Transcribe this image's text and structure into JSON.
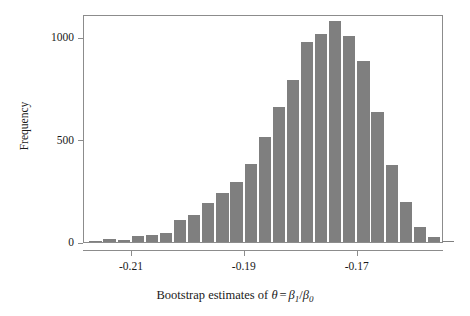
{
  "chart_data": {
    "type": "bar",
    "subtype": "histogram",
    "title": "",
    "subtitle": "",
    "xlabel": "Bootstrap estimates of θ = β₁/β₀",
    "xlabel_parts": {
      "prefix": "Bootstrap estimates of ",
      "theta": "θ",
      "equals": "=",
      "numerator": "β",
      "numerator_sub": "1",
      "slash": "/",
      "denominator": "β",
      "denominator_sub": "0"
    },
    "ylabel": "Frequency",
    "xlim": [
      -0.2185,
      -0.1547
    ],
    "ylim": [
      0,
      1113
    ],
    "xticks": [
      -0.21,
      -0.19,
      -0.17
    ],
    "xtick_labels": [
      "-0.21",
      "-0.19",
      "-0.17"
    ],
    "yticks": [
      0,
      500,
      1000
    ],
    "ytick_labels": [
      "0",
      "500",
      "1000"
    ],
    "grid": false,
    "legend": false,
    "bar_color": "#7f7f7f",
    "axis_color": "#8c8c8c",
    "text_color": "#1a1a1a",
    "background_color": "#ffffff",
    "bin_width": 0.0025,
    "n_bins": 26,
    "bins": [
      {
        "x": -0.2163,
        "value": 4
      },
      {
        "x": -0.2138,
        "value": 14
      },
      {
        "x": -0.2113,
        "value": 11
      },
      {
        "x": -0.2088,
        "value": 31
      },
      {
        "x": -0.2063,
        "value": 32
      },
      {
        "x": -0.2038,
        "value": 46
      },
      {
        "x": -0.2013,
        "value": 107
      },
      {
        "x": -0.1988,
        "value": 134
      },
      {
        "x": -0.1963,
        "value": 190
      },
      {
        "x": -0.1938,
        "value": 239
      },
      {
        "x": -0.1913,
        "value": 294
      },
      {
        "x": -0.1888,
        "value": 379
      },
      {
        "x": -0.1863,
        "value": 513
      },
      {
        "x": -0.1838,
        "value": 660
      },
      {
        "x": -0.1813,
        "value": 793
      },
      {
        "x": -0.1788,
        "value": 975
      },
      {
        "x": -0.1763,
        "value": 1017
      },
      {
        "x": -0.1738,
        "value": 1080
      },
      {
        "x": -0.1713,
        "value": 1005
      },
      {
        "x": -0.1688,
        "value": 883
      },
      {
        "x": -0.1663,
        "value": 637
      },
      {
        "x": -0.1638,
        "value": 376
      },
      {
        "x": -0.1613,
        "value": 196
      },
      {
        "x": -0.1588,
        "value": 73
      },
      {
        "x": -0.1563,
        "value": 26
      },
      {
        "x": -0.1538,
        "value": 3
      }
    ]
  }
}
